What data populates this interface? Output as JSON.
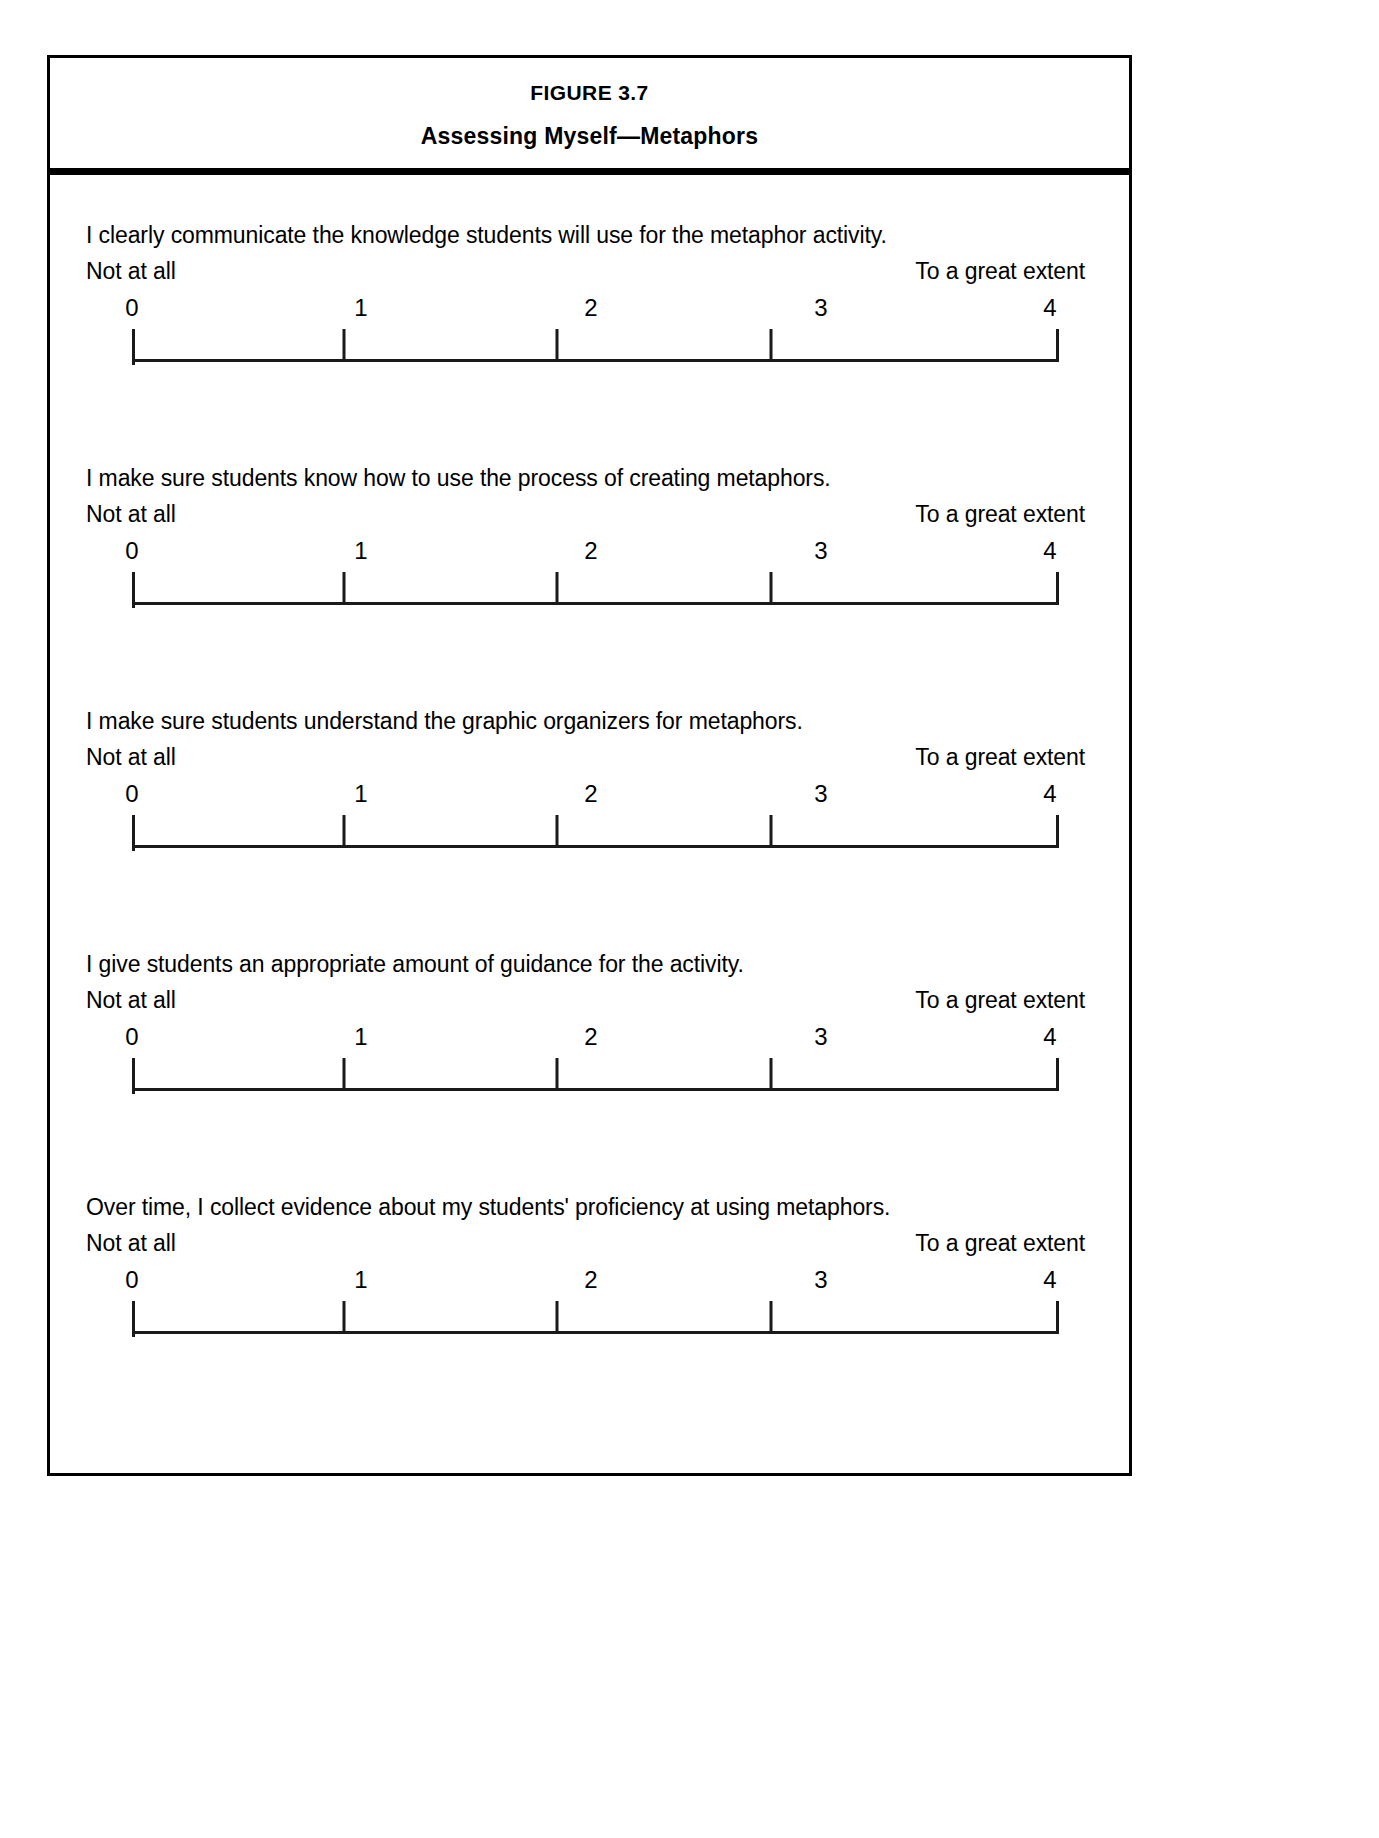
{
  "figure": {
    "number": "FIGURE 3.7",
    "title": "Assessing Myself—Metaphors"
  },
  "scale_labels": {
    "low": "Not at all",
    "high": "To a great extent",
    "ticks": [
      "0",
      "1",
      "2",
      "3",
      "4"
    ]
  },
  "items": [
    {
      "statement": "I clearly communicate the knowledge students will use for the metaphor activity.",
      "low": "Not at all",
      "high": "To a great extent",
      "t0": "0",
      "t1": "1",
      "t2": "2",
      "t3": "3",
      "t4": "4"
    },
    {
      "statement": "I make sure students know how to use the process of creating metaphors.",
      "low": "Not at all",
      "high": "To a great extent",
      "t0": "0",
      "t1": "1",
      "t2": "2",
      "t3": "3",
      "t4": "4"
    },
    {
      "statement": "I make sure students understand the graphic organizers for metaphors.",
      "low": "Not at all",
      "high": "To a great extent",
      "t0": "0",
      "t1": "1",
      "t2": "2",
      "t3": "3",
      "t4": "4"
    },
    {
      "statement": "I give students an appropriate amount of guidance for the activity.",
      "low": "Not at all",
      "high": "To a great extent",
      "t0": "0",
      "t1": "1",
      "t2": "2",
      "t3": "3",
      "t4": "4"
    },
    {
      "statement": "Over time, I collect evidence about my students' proficiency at using metaphors.",
      "low": "Not at all",
      "high": "To a great extent",
      "t0": "0",
      "t1": "1",
      "t2": "2",
      "t3": "3",
      "t4": "4"
    }
  ]
}
